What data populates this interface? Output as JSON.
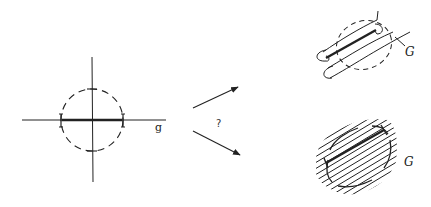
{
  "diagram": {
    "left_panel": {
      "axis_label": "g",
      "elements": [
        "horizontal-axis",
        "vertical-axis",
        "dashed-circle-neighborhood",
        "thick-segment-with-end-brackets"
      ]
    },
    "transition": {
      "question_mark": "?",
      "arrows": [
        "upper-arrow",
        "lower-arrow"
      ]
    },
    "top_right_panel": {
      "label": "G",
      "elements": [
        "dashed-ellipse-neighborhood",
        "tube-around-segment",
        "curve-G"
      ]
    },
    "bottom_right_panel": {
      "label": "G",
      "elements": [
        "hatched-foliation",
        "dashed-boundary",
        "thick-segment"
      ]
    },
    "colors": {
      "ink": "#222222",
      "background": "#ffffff"
    }
  }
}
